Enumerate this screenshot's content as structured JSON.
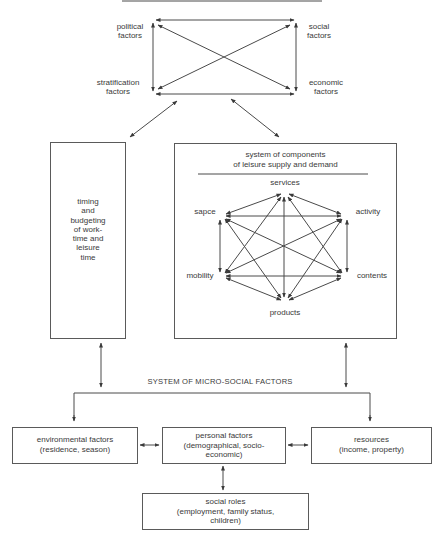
{
  "macro": {
    "political": "political\nfactors",
    "social": "social\nfactors",
    "stratification": "stratification\nfactors",
    "economic": "economic\nfactors"
  },
  "left_box": {
    "lines": [
      "timing",
      "and",
      "budgeting",
      "of work-",
      "time and",
      "leisure",
      "time"
    ]
  },
  "right_box": {
    "title_line1": "system of components",
    "title_line2": "of leisure supply and demand",
    "nodes": {
      "services": "services",
      "activity": "activity",
      "contents": "contents",
      "products": "products",
      "mobility": "mobility",
      "space": "sapce"
    }
  },
  "micro": {
    "title": "SYSTEM OF MICRO-SOCIAL FACTORS",
    "environmental": {
      "line1": "environmental factors",
      "line2": "(residence, season)"
    },
    "personal": {
      "line1": "personal factors",
      "line2": "(demographical, socio-",
      "line3": "economic)"
    },
    "resources": {
      "line1": "resources",
      "line2": "(income, property)"
    },
    "social_roles": {
      "line1": "social roles",
      "line2": "(employment, family status,",
      "line3": "children)"
    }
  },
  "colors": {
    "line": "#4a4a4a",
    "text": "#3a3a3a"
  }
}
